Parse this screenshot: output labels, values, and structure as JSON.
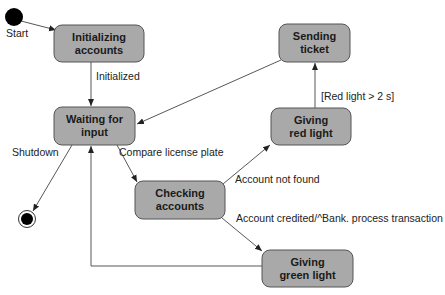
{
  "diagram": {
    "type": "uml-state-machine",
    "colors": {
      "state_fill": "#a9a9a9",
      "state_border": "#555555",
      "text": "#1a1a1a",
      "edge": "#444444",
      "pseudo_state": "#000000"
    },
    "initial": {
      "label": "Start"
    },
    "final": {
      "label": ""
    },
    "states": {
      "initializing": {
        "line1": "Initializing",
        "line2": "accounts"
      },
      "waiting": {
        "line1": "Waiting for",
        "line2": "input"
      },
      "sending": {
        "line1": "Sending",
        "line2": "ticket"
      },
      "red": {
        "line1": "Giving",
        "line2": "red light"
      },
      "checking": {
        "line1": "Checking",
        "line2": "accounts"
      },
      "green": {
        "line1": "Giving",
        "line2": "green light"
      }
    },
    "transitions": {
      "start_to_init": {
        "from": "initial",
        "to": "Initializing accounts",
        "label": "Start"
      },
      "init_to_wait": {
        "from": "Initializing accounts",
        "to": "Waiting for input",
        "label": "Initialized"
      },
      "wait_to_final": {
        "from": "Waiting for input",
        "to": "final",
        "label": "Shutdown"
      },
      "wait_to_check": {
        "from": "Waiting for input",
        "to": "Checking accounts",
        "label": "Compare license plate"
      },
      "check_to_red": {
        "from": "Checking accounts",
        "to": "Giving red light",
        "label": "Account not found"
      },
      "check_to_green": {
        "from": "Checking accounts",
        "to": "Giving green light",
        "label": "Account credited/^Bank. process transaction"
      },
      "red_to_send": {
        "from": "Giving red light",
        "to": "Sending ticket",
        "label": "[Red light > 2 s]"
      },
      "send_to_wait": {
        "from": "Sending ticket",
        "to": "Waiting for input",
        "label": ""
      },
      "green_to_wait": {
        "from": "Giving green light",
        "to": "Waiting for input",
        "label": ""
      }
    }
  }
}
